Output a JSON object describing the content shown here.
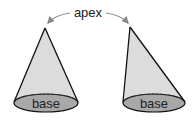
{
  "diagram": {
    "title_label": "apex",
    "cones": [
      {
        "name": "right-cone",
        "base_label": "base"
      },
      {
        "name": "oblique-cone",
        "base_label": "base"
      }
    ],
    "colors": {
      "side_fill": "#d9d9d9",
      "base_fill": "#a6a6a6",
      "outline": "#111111",
      "arrow": "#888888"
    }
  }
}
